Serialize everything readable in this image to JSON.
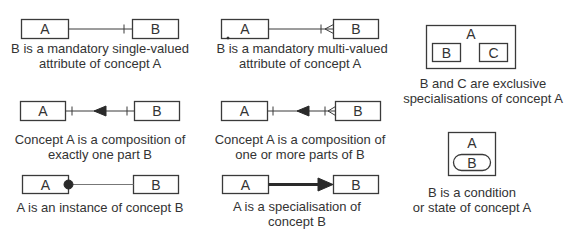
{
  "panels": [
    {
      "id": "mandatory-single",
      "box_a": "A",
      "box_b": "B",
      "connector": "single-bar",
      "caption": [
        "B is a mandatory single-valued",
        "attribute of concept A"
      ]
    },
    {
      "id": "mandatory-multi",
      "box_a": "A",
      "box_b": "B",
      "connector": "bar-crowsfoot",
      "caption": [
        "B is a mandatory multi-valued",
        "attribute of concept A"
      ]
    },
    {
      "id": "exclusive-specialisations",
      "outer": "A",
      "inner_left": "B",
      "inner_right": "C",
      "caption": [
        "B and C are exclusive",
        "specialisations of concept A"
      ]
    },
    {
      "id": "composition-one",
      "box_a": "A",
      "box_b": "B",
      "connector": "bar-arrow-bar",
      "caption": [
        "Concept A is a composition of",
        "exactly one part B"
      ]
    },
    {
      "id": "composition-many",
      "box_a": "A",
      "box_b": "B",
      "connector": "bar-arrow-bar-crowsfoot",
      "caption": [
        "Concept A is a composition of",
        "one or more parts of B"
      ]
    },
    {
      "id": "condition-state",
      "outer": "A",
      "inner_pill": "B",
      "caption": [
        "B is a condition",
        "or state of concept A"
      ]
    },
    {
      "id": "instance",
      "box_a": "A",
      "box_b": "B",
      "connector": "dot",
      "caption": [
        "A is an instance of concept B"
      ]
    },
    {
      "id": "specialisation",
      "box_a": "A",
      "box_b": "B",
      "connector": "thick-arrow",
      "caption": [
        "A is a specialisation  of",
        "concept B"
      ]
    }
  ]
}
